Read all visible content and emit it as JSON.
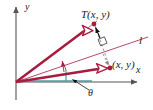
{
  "figure": {
    "colors": {
      "vector_crimson": "#A81C3F",
      "thin_crimson": "#B8476A",
      "axis_gray": "#555555",
      "teal": "#4E9E9E",
      "dashed_gray": "#7a7a7a",
      "label_black": "#1a1a1a",
      "background": "#ffffff"
    },
    "labels": {
      "point_T": "T(x, y)",
      "point_xy": "(x, y)",
      "line_l": "l",
      "axis_x": "x",
      "axis_y": "y",
      "angle_theta": "θ"
    },
    "geometry": {
      "origin": [
        16,
        82
      ],
      "point_T": [
        93,
        24
      ],
      "point_xy": [
        109,
        68
      ],
      "line_l_start": [
        16,
        82
      ],
      "line_l_end": [
        148,
        37
      ],
      "x_axis_start": [
        16,
        82
      ],
      "x_axis_end": [
        140,
        82
      ],
      "y_axis_top": [
        16,
        6
      ],
      "y_axis_bottom": [
        16,
        100
      ],
      "theta_arc_radius": 38,
      "right_angle_marker": [
        103,
        43
      ]
    }
  }
}
